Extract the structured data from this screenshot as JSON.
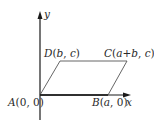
{
  "diagram": {
    "type": "coordinate-geometry-parallelogram",
    "axes": {
      "x_label": "x",
      "y_label": "y"
    },
    "points": [
      {
        "id": "A",
        "name": "A",
        "coords": "(0, 0)",
        "x_text": "0",
        "y_text": "0"
      },
      {
        "id": "B",
        "name": "B",
        "coords": "(a, 0)",
        "x_text": "a",
        "y_text": "0"
      },
      {
        "id": "C",
        "name": "C",
        "coords": "(a+b, c)",
        "x_text": "a+b",
        "y_text": "c"
      },
      {
        "id": "D",
        "name": "D",
        "coords": "(b, c)",
        "x_text": "b",
        "y_text": "c"
      }
    ],
    "colors": {
      "axis": "#1a1a1a",
      "shape": "#555555",
      "text": "#2a2a2a"
    }
  }
}
